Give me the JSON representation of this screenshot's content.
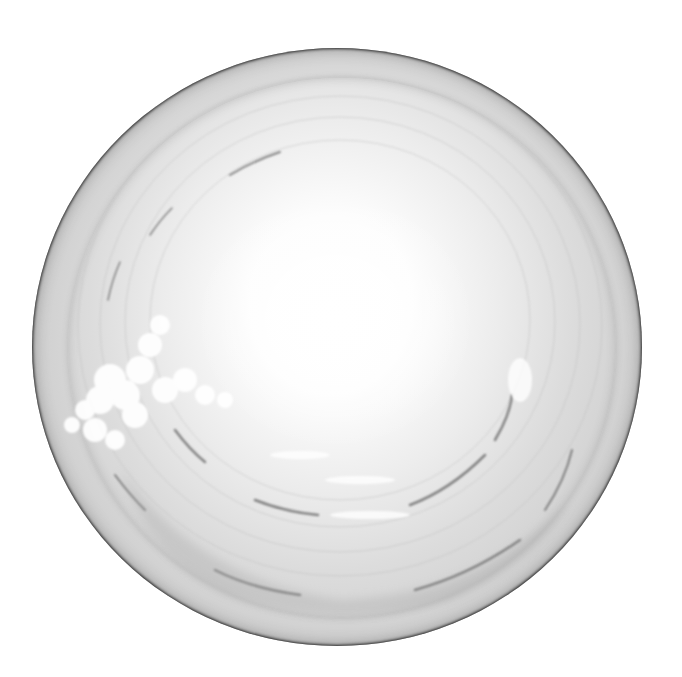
{
  "image": {
    "subject": "circular bowl-like swirl with cloud",
    "palette": {
      "background": "#ffffff",
      "rim": "#2a2a2a",
      "mid_gray": "#cfcfcf",
      "center_light": "#ffffff"
    }
  }
}
